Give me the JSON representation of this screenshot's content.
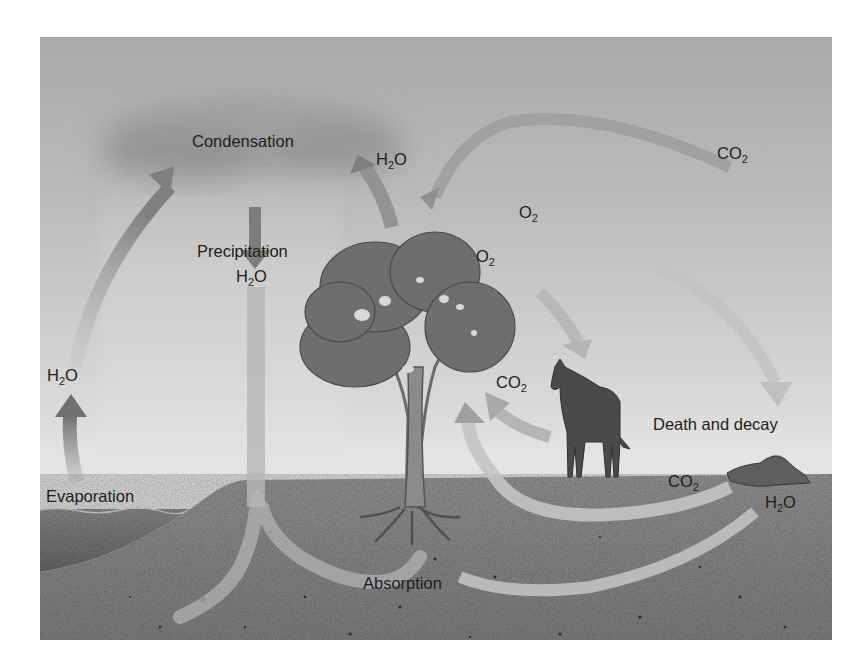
{
  "diagram": {
    "colors": {
      "sky_top": "#a9a9a9",
      "sky_bottom": "#e4e4e4",
      "ground": "#8c8c8c",
      "water": "#777777",
      "arrow_dark": "#7d7d7d",
      "arrow_light": "#bdbdbd",
      "tree_canopy": "#6e6e6e",
      "horse": "#4a4a4a",
      "text": "#1d1d1d"
    },
    "labels": {
      "condensation": "Condensation",
      "precipitation": "Precipitation",
      "precip_h2o": {
        "main": "H",
        "sub": "2",
        "tail": "O"
      },
      "h2o_transpiration": {
        "main": "H",
        "sub": "2",
        "tail": "O"
      },
      "co2_atmosphere": {
        "main": "CO",
        "sub": "2",
        "tail": ""
      },
      "o2_upper": {
        "main": "O",
        "sub": "2",
        "tail": ""
      },
      "o2_tree": {
        "main": "O",
        "sub": "2",
        "tail": ""
      },
      "co2_horse": {
        "main": "CO",
        "sub": "2",
        "tail": ""
      },
      "h2o_evaporation": {
        "main": "H",
        "sub": "2",
        "tail": "O"
      },
      "evaporation": "Evaporation",
      "death_and_decay": "Death and decay",
      "co2_decay": {
        "main": "CO",
        "sub": "2",
        "tail": ""
      },
      "h2o_decay": {
        "main": "H",
        "sub": "2",
        "tail": "O"
      },
      "absorption": "Absorption"
    },
    "nodes": [
      "Condensation",
      "Precipitation",
      "Evaporation",
      "Absorption",
      "Death and decay",
      "Tree",
      "Horse",
      "Decaying carcass"
    ],
    "flows": [
      {
        "from": "Evaporation",
        "to": "Condensation",
        "substance": "H2O"
      },
      {
        "from": "Condensation",
        "to": "Precipitation",
        "substance": "H2O"
      },
      {
        "from": "Precipitation",
        "to": "Absorption",
        "substance": "H2O"
      },
      {
        "from": "Tree",
        "to": "Condensation",
        "substance": "H2O"
      },
      {
        "from": "Atmosphere",
        "to": "Tree",
        "substance": "CO2"
      },
      {
        "from": "Tree",
        "to": "Death and decay",
        "substance": "O2"
      },
      {
        "from": "Tree",
        "to": "Horse",
        "substance": "O2"
      },
      {
        "from": "Horse",
        "to": "Tree",
        "substance": "CO2"
      },
      {
        "from": "Death and decay",
        "to": "Tree",
        "substance": "CO2"
      },
      {
        "from": "Death and decay",
        "to": "Absorption",
        "substance": "H2O"
      }
    ]
  }
}
